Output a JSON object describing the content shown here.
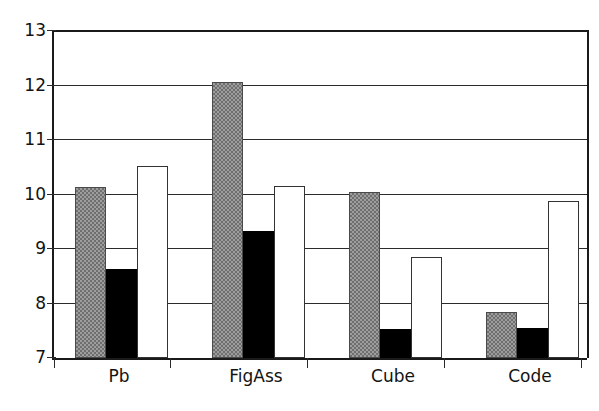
{
  "chart_data": {
    "type": "bar",
    "title": "",
    "subtitle": "",
    "xlabel": "",
    "ylabel": "",
    "categories": [
      "Pb",
      "FigAss",
      "Cube",
      "Code"
    ],
    "series": [
      {
        "name": "Series 1",
        "color": "#9d9d9d",
        "fill": "gray-checker",
        "values": [
          10.12,
          12.05,
          10.03,
          7.85
        ]
      },
      {
        "name": "Series 2",
        "color": "#000000",
        "fill": "black-solid",
        "values": [
          8.62,
          9.33,
          7.53,
          7.55
        ]
      },
      {
        "name": "Series 3",
        "color": "#ffffff",
        "fill": "white-outline",
        "values": [
          10.52,
          10.15,
          8.85,
          9.87
        ]
      }
    ],
    "ylim": [
      7,
      13
    ],
    "yticks": [
      7,
      8,
      9,
      10,
      11,
      12,
      13
    ],
    "ytick_labels": [
      "7",
      "8",
      "9",
      "10",
      "11",
      "12",
      "13"
    ],
    "grid": "horizontal",
    "legend": "none",
    "legend_position": "none",
    "bar_baseline": 7,
    "annotations": []
  },
  "axes": {
    "y_axis_name": "y-axis",
    "x_axis_name": "x-axis",
    "y_tick_values": [
      "13",
      "12",
      "11",
      "10",
      "9",
      "8",
      "7"
    ]
  }
}
